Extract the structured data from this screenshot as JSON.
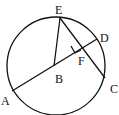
{
  "diagram": {
    "type": "circle-geometry",
    "circle": {
      "cx": 56,
      "cy": 66,
      "r": 50
    },
    "points": {
      "A": {
        "label": "A",
        "x": 12,
        "y": 91
      },
      "B": {
        "label": "B",
        "x": 54,
        "y": 66
      },
      "C": {
        "label": "C",
        "x": 105,
        "y": 78
      },
      "D": {
        "label": "D",
        "x": 97,
        "y": 39
      },
      "E": {
        "label": "E",
        "x": 60,
        "y": 18
      },
      "F": {
        "label": "F",
        "x": 82,
        "y": 50
      }
    },
    "segments": [
      "AD",
      "EC",
      "EB"
    ],
    "right_angle_at": "F"
  }
}
